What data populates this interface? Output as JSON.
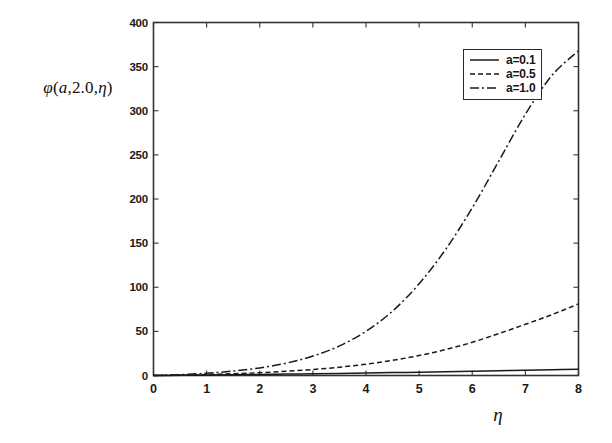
{
  "chart_data": {
    "type": "line",
    "title": "",
    "xlabel": "η",
    "ylabel": "φ(a,2.0,η)",
    "ylabel_parts": {
      "phi": "φ",
      "open": "(",
      "a": "a",
      "comma1": ",",
      "const": "2.0",
      "comma2": ",",
      "eta": "η",
      "close": ")"
    },
    "xlim": [
      0,
      8
    ],
    "ylim": [
      0,
      400
    ],
    "xticks": [
      0,
      1,
      2,
      3,
      4,
      5,
      6,
      7,
      8
    ],
    "xtick_labels": [
      "0",
      "1",
      "2",
      "3",
      "4",
      "5",
      "6",
      "7",
      "8"
    ],
    "yticks": [
      0,
      50,
      100,
      150,
      200,
      250,
      300,
      350,
      400
    ],
    "ytick_labels": [
      "0",
      "50",
      "100",
      "150",
      "200",
      "250",
      "300",
      "350",
      "400"
    ],
    "grid": false,
    "legend_position": "upper right",
    "line_color": "#1a1a1a",
    "axis_color": "#333333",
    "background": "#ffffff",
    "x": [
      0,
      0.5,
      1,
      1.5,
      2,
      2.5,
      3,
      3.5,
      4,
      4.5,
      5,
      5.5,
      6,
      6.5,
      7,
      7.5,
      8
    ],
    "series": [
      {
        "name": "a=0.1",
        "label": "a=0.1",
        "dash": "solid",
        "dasharray": "none",
        "values": [
          0,
          0.2,
          0.5,
          0.8,
          1.2,
          1.6,
          2.0,
          2.4,
          2.9,
          3.3,
          3.8,
          4.3,
          4.8,
          5.4,
          6.0,
          6.6,
          7.2
        ]
      },
      {
        "name": "a=0.5",
        "label": "a=0.5",
        "dash": "dashed",
        "dasharray": "5,3",
        "values": [
          0,
          0.4,
          1.1,
          2.0,
          3.2,
          4.8,
          6.8,
          9.4,
          12.8,
          17.2,
          22.6,
          29.4,
          37.6,
          47.5,
          58.0,
          69.0,
          81.0
        ]
      },
      {
        "name": "a=1.0",
        "label": "a=1.0",
        "dash": "dashdot",
        "dasharray": "9,3,2,3",
        "values": [
          0,
          1.0,
          2.6,
          5.0,
          8.6,
          14.0,
          22.0,
          33.5,
          50.0,
          73.0,
          104.0,
          143.0,
          190.0,
          243.0,
          296.0,
          340.0,
          368.0
        ]
      }
    ]
  }
}
